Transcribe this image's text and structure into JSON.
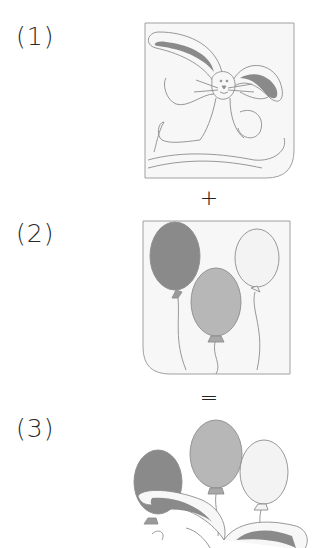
{
  "steps": [
    {
      "label": "(1)",
      "description": "bunny illustration"
    },
    {
      "label": "(2)",
      "description": "three balloons illustration"
    },
    {
      "label": "(3)",
      "description": "combined bunny with balloons"
    }
  ],
  "operators": {
    "plus": "+",
    "equals": "="
  },
  "colors": {
    "dark_fill": "#8a8a8a",
    "medium_fill": "#b7b7b7",
    "light_fill": "#f3f3f3",
    "line": "#8c8c8c",
    "frame_bg": "#f7f7f7",
    "frame_border": "#a0a0a0"
  }
}
